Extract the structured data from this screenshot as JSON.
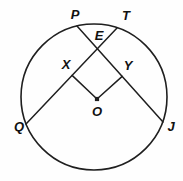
{
  "diagram": {
    "kind": "geometry-circle-diagram",
    "background": "#fefefe",
    "stroke_color": "#1f1f1f",
    "label_color": "#111111",
    "stroke_width": 1.6,
    "circle": {
      "cx": 94,
      "cy": 97,
      "r": 73
    },
    "points": {
      "P": {
        "x": 77,
        "y": 26
      },
      "T": {
        "x": 117,
        "y": 28
      },
      "Q": {
        "x": 26,
        "y": 124
      },
      "J": {
        "x": 163,
        "y": 122
      },
      "E": {
        "x": 97.3,
        "y": 48.7
      },
      "X": {
        "x": 72.1,
        "y": 75.4
      },
      "Y": {
        "x": 122.2,
        "y": 76.4
      },
      "O": {
        "x": 97,
        "y": 99
      }
    },
    "segments": [
      {
        "name": "chord-QT",
        "from": "Q",
        "to": "T"
      },
      {
        "name": "chord-PJ",
        "from": "P",
        "to": "J"
      },
      {
        "name": "segment-OX",
        "from": "O",
        "to": "X"
      },
      {
        "name": "segment-OY",
        "from": "O",
        "to": "Y"
      }
    ],
    "center_dot": {
      "x": 97,
      "y": 99,
      "size": 4.2
    },
    "labels": [
      {
        "text": "P",
        "x": 75,
        "y": 16
      },
      {
        "text": "T",
        "x": 126,
        "y": 17
      },
      {
        "text": "E",
        "x": 99,
        "y": 37
      },
      {
        "text": "X",
        "x": 66,
        "y": 66
      },
      {
        "text": "Y",
        "x": 128,
        "y": 67
      },
      {
        "text": "O",
        "x": 97,
        "y": 113
      },
      {
        "text": "Q",
        "x": 19,
        "y": 128
      },
      {
        "text": "J",
        "x": 171,
        "y": 128
      }
    ]
  }
}
